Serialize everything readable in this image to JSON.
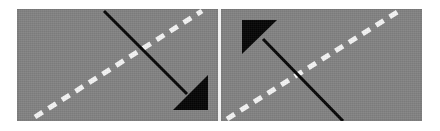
{
  "figure": {
    "title": "",
    "background_color": "#ffffff",
    "panel_count": 2,
    "panel_gap_color": "#ffffff"
  },
  "panels": [
    {
      "id": "left-panel",
      "name": "left-road-scene",
      "background_color": "#828282",
      "lane_marking": {
        "name": "dashed-lane-line",
        "color": "#f5f5f5",
        "style": "dashed",
        "orientation": "diagonal-bottom-left-to-top-right",
        "dash_length": 9,
        "dash_gap": 7,
        "stroke_width": 5,
        "x1": 18,
        "y1": 108,
        "x2": 185,
        "y2": 2
      },
      "arrow": {
        "name": "direction-arrow-down-right",
        "color": "#050505",
        "direction": "down-right",
        "shaft": {
          "x1": 87,
          "y1": 2,
          "x2": 170,
          "y2": 85,
          "stroke_width": 3
        },
        "head_points": "191,66 191,101 156,101"
      }
    },
    {
      "id": "right-panel",
      "name": "right-road-scene",
      "background_color": "#828282",
      "lane_marking": {
        "name": "dashed-lane-line",
        "color": "#f5f5f5",
        "style": "dashed",
        "orientation": "diagonal-bottom-left-to-top-right",
        "dash_length": 9,
        "dash_gap": 7,
        "stroke_width": 5,
        "x1": 6,
        "y1": 110,
        "x2": 178,
        "y2": 2
      },
      "arrow": {
        "name": "direction-arrow-up-left",
        "color": "#050505",
        "direction": "up-left",
        "shaft": {
          "x1": 42,
          "y1": 30,
          "x2": 122,
          "y2": 112,
          "stroke_width": 3
        },
        "head_points": "21,11 56,11 21,45"
      }
    }
  ],
  "colors": {
    "road_gray": "#828282",
    "lane_white": "#f5f5f5",
    "arrow_black": "#050505",
    "page_white": "#ffffff"
  }
}
